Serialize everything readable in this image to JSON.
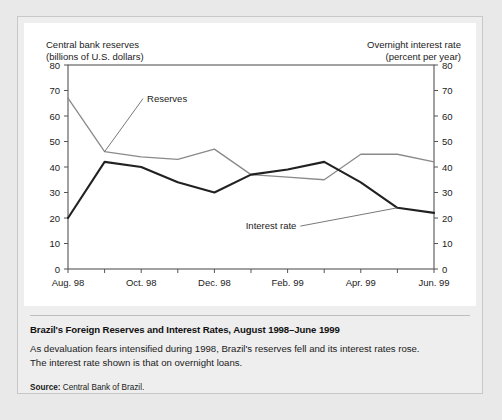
{
  "figure": {
    "caption_title": "Brazil's Foreign Reserves and Interest Rates, August 1998–June 1999",
    "caption_body": "As devaluation fears intensified during 1998, Brazil's reserves fell and its interest rates rose. The interest rate shown is that on overnight loans.",
    "source_label": "Source:",
    "source_text": "Central Bank of Brazil."
  },
  "chart_data": {
    "type": "line",
    "title": "Brazil's Foreign Reserves and Interest Rates, August 1998–June 1999",
    "xlabel": "",
    "ylabel": "Central bank reserves\n(billions of U.S. dollars)",
    "y2label": "Overnight interest rate\n(percent per year)",
    "ylim": [
      0,
      80
    ],
    "y2lim": [
      0,
      80
    ],
    "yticks": [
      0,
      10,
      20,
      30,
      40,
      50,
      60,
      70,
      80
    ],
    "y2ticks": [
      0,
      10,
      20,
      30,
      40,
      50,
      60,
      70,
      80
    ],
    "grid": false,
    "legend_position": "inline-annotation",
    "x": [
      "Aug. 98",
      "Sep. 98",
      "Oct. 98",
      "Nov. 98",
      "Dec. 98",
      "Jan. 99",
      "Feb. 99",
      "Mar. 99",
      "Apr. 99",
      "May 99",
      "Jun. 99"
    ],
    "xtick_labels": [
      "Aug. 98",
      "Oct. 98",
      "Dec. 98",
      "Feb. 99",
      "Apr. 99",
      "Jun. 99"
    ],
    "xtick_indices": [
      0,
      2,
      4,
      6,
      8,
      10
    ],
    "series": [
      {
        "name": "Reserves",
        "axis": "left",
        "color": "#8a8a8a",
        "values": [
          67,
          46,
          44,
          43,
          47,
          37,
          36,
          35,
          45,
          45,
          42
        ]
      },
      {
        "name": "Interest rate",
        "axis": "right",
        "color": "#212121",
        "values": [
          20,
          42,
          40,
          34,
          30,
          37,
          39,
          42,
          34,
          24,
          22
        ]
      }
    ],
    "annotations": [
      {
        "text": "Reserves",
        "series": "Reserves",
        "x_index": 1,
        "label_x": 2.05,
        "label_y": 68
      },
      {
        "text": "Interest rate",
        "series": "Interest rate",
        "x_index": 9,
        "label_x": 6.35,
        "label_y": 18
      }
    ]
  }
}
